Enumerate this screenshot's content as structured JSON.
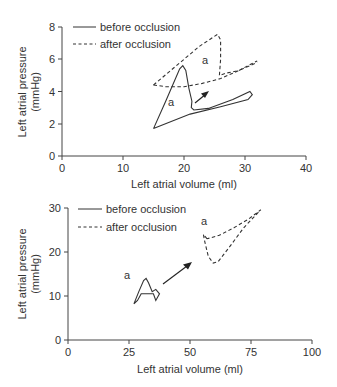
{
  "chart_data": [
    {
      "type": "line",
      "title": "",
      "xlabel": "Left atrial volume (ml)",
      "ylabel": "Left atrial pressure (mmHg)",
      "ylabel_line1": "Left atrial pressure",
      "ylabel_line2": "(mmHg)",
      "xlim": [
        0,
        40
      ],
      "ylim": [
        0,
        8
      ],
      "xticks": [
        "0",
        "10",
        "20",
        "30",
        "40"
      ],
      "yticks": [
        "0",
        "2",
        "4",
        "6",
        "8"
      ],
      "grid": false,
      "legend_position": "top-left",
      "legend": [
        "before occlusion",
        "after occlusion"
      ],
      "annotations": [
        "a",
        "a"
      ],
      "series": [
        {
          "name": "before occlusion",
          "style": "solid",
          "points": [
            [
              15,
              1.7
            ],
            [
              17,
              3.4
            ],
            [
              19.3,
              5.4
            ],
            [
              19.8,
              5.6
            ],
            [
              20.3,
              5.3
            ],
            [
              20.8,
              4.2
            ],
            [
              21.3,
              3.4
            ],
            [
              21.2,
              3.0
            ],
            [
              21.6,
              2.85
            ],
            [
              24,
              2.95
            ],
            [
              28,
              3.5
            ],
            [
              30.8,
              4.0
            ],
            [
              31.2,
              3.8
            ],
            [
              30.5,
              3.5
            ],
            [
              26,
              3.05
            ],
            [
              21,
              2.6
            ],
            [
              15,
              1.7
            ]
          ]
        },
        {
          "name": "after occlusion",
          "style": "dashed",
          "points": [
            [
              15,
              4.4
            ],
            [
              17.5,
              5.2
            ],
            [
              20,
              6.0
            ],
            [
              22.5,
              6.8
            ],
            [
              25.5,
              7.55
            ],
            [
              26,
              7.2
            ],
            [
              26,
              6.0
            ],
            [
              25.8,
              5.0
            ],
            [
              27,
              5.15
            ],
            [
              29,
              5.3
            ],
            [
              32,
              5.9
            ]
          ],
          "lower_branch": [
            [
              15,
              4.4
            ],
            [
              17,
              4.3
            ],
            [
              20,
              4.3
            ],
            [
              23,
              4.5
            ],
            [
              26,
              4.8
            ],
            [
              29,
              5.3
            ],
            [
              32,
              5.8
            ]
          ]
        }
      ]
    },
    {
      "type": "line",
      "title": "",
      "xlabel": "Left atrial volume (ml)",
      "ylabel": "Left atrial pressure (mmHg)",
      "ylabel_line1": "Left atrial pressure",
      "ylabel_line2": "(mmHg)",
      "xlim": [
        0,
        100
      ],
      "ylim": [
        0,
        30
      ],
      "xticks": [
        "0",
        "25",
        "50",
        "75",
        "100"
      ],
      "yticks": [
        "0",
        "10",
        "20",
        "30"
      ],
      "grid": false,
      "legend_position": "top-left",
      "legend": [
        "before occlusion",
        "after occlusion"
      ],
      "annotations": [
        "a",
        "a"
      ],
      "series": [
        {
          "name": "before occlusion",
          "style": "solid",
          "points": [
            [
              27,
              8.2
            ],
            [
              29,
              11
            ],
            [
              31,
              13.5
            ],
            [
              32,
              14
            ],
            [
              33,
              13
            ],
            [
              34.5,
              11
            ],
            [
              36,
              11.5
            ],
            [
              37.5,
              10.5
            ],
            [
              36,
              9
            ],
            [
              35,
              10.5
            ],
            [
              33,
              10.5
            ],
            [
              30,
              10.5
            ],
            [
              28.5,
              9
            ],
            [
              27,
              8.2
            ]
          ]
        },
        {
          "name": "after occlusion",
          "style": "dashed",
          "points": [
            [
              57,
              23
            ],
            [
              55.5,
              24
            ],
            [
              56,
              22.5
            ],
            [
              57.5,
              19
            ],
            [
              59.5,
              17.5
            ],
            [
              61.5,
              17.8
            ],
            [
              66,
              21
            ],
            [
              72,
              25.5
            ],
            [
              78.5,
              29.3
            ],
            [
              79,
              29.6
            ],
            [
              74,
              27.5
            ],
            [
              68,
              25.5
            ],
            [
              62,
              23.8
            ],
            [
              57,
              23
            ]
          ]
        }
      ]
    }
  ],
  "legend": {
    "before": "before occlusion",
    "after": "after occlusion"
  },
  "annotation_label": "a"
}
